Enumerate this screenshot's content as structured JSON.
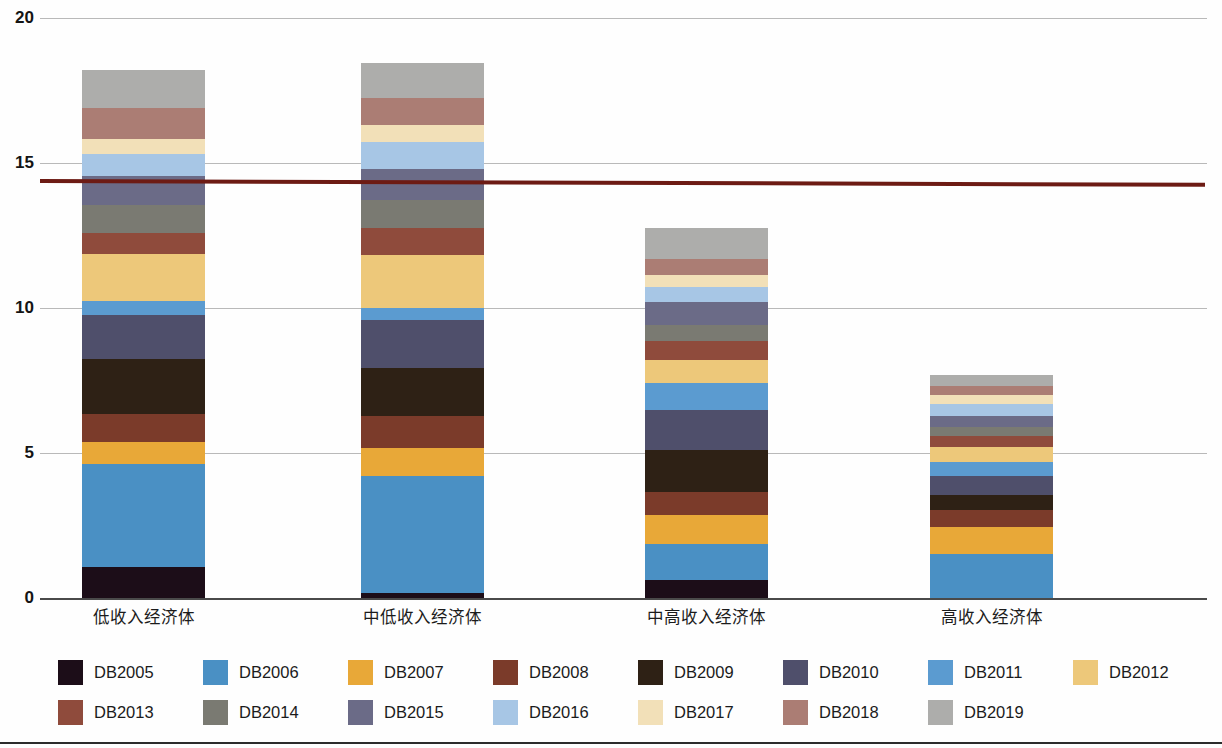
{
  "chart_data": {
    "type": "bar",
    "stacked": true,
    "title": "",
    "xlabel": "",
    "ylabel": "",
    "ylim": [
      0,
      20
    ],
    "yticks": [
      0,
      5,
      10,
      15,
      20
    ],
    "ytick_labels": [
      "0",
      "5",
      "10",
      "15",
      "20"
    ],
    "grid": true,
    "legend_position": "bottom",
    "categories": [
      "低收入经济体",
      "中低收入经济体",
      "中高收入经济体",
      "高收入经济体"
    ],
    "series": [
      {
        "name": "DB2005",
        "color": "#1c0d18",
        "values": [
          1.07,
          0.17,
          0.62,
          0.0
        ]
      },
      {
        "name": "DB2006",
        "color": "#4a90c4",
        "values": [
          3.55,
          4.03,
          1.24,
          1.52
        ]
      },
      {
        "name": "DB2007",
        "color": "#e8a838",
        "values": [
          0.76,
          0.97,
          1.0,
          0.93
        ]
      },
      {
        "name": "DB2008",
        "color": "#7b3b2a",
        "values": [
          0.97,
          1.1,
          0.79,
          0.59
        ]
      },
      {
        "name": "DB2009",
        "color": "#2e2115",
        "values": [
          1.9,
          1.66,
          1.45,
          0.52
        ]
      },
      {
        "name": "DB2010",
        "color": "#4f4f6b",
        "values": [
          1.52,
          1.66,
          1.38,
          0.66
        ]
      },
      {
        "name": "DB2011",
        "color": "#5b9bd0",
        "values": [
          0.48,
          0.41,
          0.93,
          0.48
        ]
      },
      {
        "name": "DB2012",
        "color": "#edc87a",
        "values": [
          1.62,
          1.83,
          0.79,
          0.52
        ]
      },
      {
        "name": "DB2013",
        "color": "#8f4b3c",
        "values": [
          0.72,
          0.93,
          0.66,
          0.38
        ]
      },
      {
        "name": "DB2014",
        "color": "#7a7a72",
        "values": [
          0.97,
          0.97,
          0.55,
          0.31
        ]
      },
      {
        "name": "DB2015",
        "color": "#6b6b87",
        "values": [
          1.0,
          1.07,
          0.79,
          0.38
        ]
      },
      {
        "name": "DB2016",
        "color": "#a7c6e5",
        "values": [
          0.76,
          0.93,
          0.52,
          0.41
        ]
      },
      {
        "name": "DB2017",
        "color": "#f2e0b8",
        "values": [
          0.52,
          0.59,
          0.41,
          0.31
        ]
      },
      {
        "name": "DB2018",
        "color": "#ab7d74",
        "values": [
          1.07,
          0.93,
          0.55,
          0.31
        ]
      },
      {
        "name": "DB2019",
        "color": "#adadab",
        "values": [
          1.31,
          1.21,
          1.07,
          0.38
        ]
      }
    ],
    "totals": [
      18.62,
      19.34,
      13.41,
      8.17
    ],
    "reference_line": {
      "color": "#6d1b14",
      "value_left": 14.45,
      "value_right": 14.32,
      "label": ""
    }
  },
  "axis": {
    "y_labels": [
      "20",
      "15",
      "10",
      "5",
      "0"
    ]
  },
  "legend": {
    "rows": [
      [
        "DB2005",
        "DB2006",
        "DB2007",
        "DB2008",
        "DB2009",
        "DB2010",
        "DB2011",
        "DB2012"
      ],
      [
        "DB2013",
        "DB2014",
        "DB2015",
        "DB2016",
        "DB2017",
        "DB2018",
        "DB2019"
      ]
    ]
  }
}
